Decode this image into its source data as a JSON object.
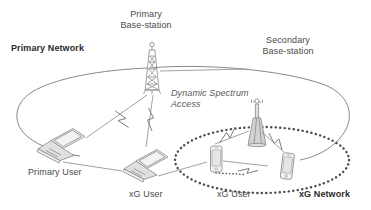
{
  "figure": {
    "type": "network-architecture-diagram",
    "background_color": "#ffffff",
    "line_color": "#6e6e6e",
    "text_color": "#4a4a4a",
    "bold_text_color": "#2b2b2b"
  },
  "labels": {
    "primary_base_station": "Primary\nBase-station",
    "secondary_base_station": "Secondary\nBase-station",
    "primary_network": "Primary Network",
    "dynamic_spectrum_access": "Dynamic Spectrum\nAccess",
    "primary_user": "Primary User",
    "xg_user_left": "xG User",
    "xg_user_right": "xG User",
    "xg_network": "xG Network"
  },
  "nodes": [
    {
      "name": "primary-base-station-tower",
      "kind": "lattice-tower",
      "x": 152,
      "y": 75
    },
    {
      "name": "secondary-base-station-antenna",
      "kind": "small-antenna",
      "x": 257,
      "y": 125
    },
    {
      "name": "primary-user-laptop",
      "kind": "laptop",
      "x": 58,
      "y": 140
    },
    {
      "name": "xg-user-laptop",
      "kind": "laptop",
      "x": 143,
      "y": 161
    },
    {
      "name": "xg-user-phone-left",
      "kind": "smartphone",
      "x": 216,
      "y": 162
    },
    {
      "name": "xg-user-phone-right",
      "kind": "smartphone",
      "x": 287,
      "y": 168
    }
  ],
  "regions": [
    {
      "name": "primary-network-boundary",
      "style": "solid-ellipse"
    },
    {
      "name": "xg-network-boundary",
      "style": "dotted-ellipse"
    }
  ],
  "links": [
    {
      "name": "link-primary-bs-to-primary-user",
      "style": "wireless-zigzag"
    },
    {
      "name": "link-primary-bs-to-xg-user-laptop",
      "style": "wireless-zigzag"
    },
    {
      "name": "link-secondary-bs-to-phone-left",
      "style": "wireless-zigzag"
    },
    {
      "name": "link-secondary-bs-to-phone-right",
      "style": "wireless-zigzag"
    },
    {
      "name": "link-phone-left-to-phone-right",
      "style": "wireless-zigzag"
    }
  ]
}
